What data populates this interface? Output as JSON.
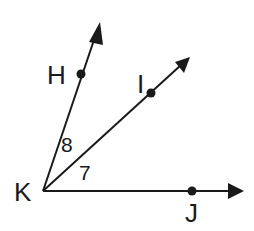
{
  "diagram": {
    "type": "angle-diagram",
    "vertex": {
      "label": "K",
      "x": 43,
      "y": 191
    },
    "rays": [
      {
        "name": "ray-KH",
        "point_label": "H",
        "point": {
          "x": 81,
          "y": 74
        },
        "tip": {
          "x": 100,
          "y": 22
        }
      },
      {
        "name": "ray-KI",
        "point_label": "I",
        "point": {
          "x": 151,
          "y": 93
        },
        "tip": {
          "x": 190,
          "y": 57
        }
      },
      {
        "name": "ray-KJ",
        "point_label": "J",
        "point": {
          "x": 192,
          "y": 191
        },
        "tip": {
          "x": 244,
          "y": 191
        }
      }
    ],
    "angles": [
      {
        "label": "8",
        "between": [
          "KH",
          "KI"
        ]
      },
      {
        "label": "7",
        "between": [
          "KI",
          "KJ"
        ]
      }
    ],
    "colors": {
      "stroke": "#1a1a1a",
      "background": "#ffffff"
    }
  },
  "labels": {
    "K": "K",
    "H": "H",
    "I": "I",
    "J": "J",
    "angle8": "8",
    "angle7": "7"
  }
}
